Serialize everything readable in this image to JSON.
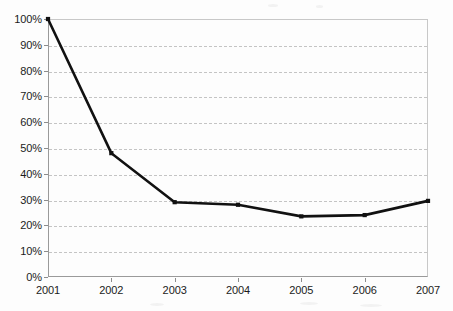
{
  "chart_data": {
    "type": "line",
    "title": "",
    "subtitle": "",
    "xlabel": "",
    "ylabel": "",
    "categories": [
      "2001",
      "2002",
      "2003",
      "2004",
      "2005",
      "2006",
      "2007"
    ],
    "series": [
      {
        "name": "",
        "values": [
          100,
          48,
          29,
          28,
          23.5,
          24,
          29.5
        ]
      }
    ],
    "ylim": [
      0,
      100
    ],
    "y_ticks": [
      0,
      10,
      20,
      30,
      40,
      50,
      60,
      70,
      80,
      90,
      100
    ],
    "y_tick_labels": [
      "0%",
      "10%",
      "20%",
      "30%",
      "40%",
      "50%",
      "60%",
      "70%",
      "80%",
      "90%",
      "100%"
    ],
    "x_tick_labels": [
      "2001",
      "2002",
      "2003",
      "2004",
      "2005",
      "2006",
      "2007"
    ],
    "grid": {
      "horizontal": true,
      "vertical": false,
      "style": "dashed",
      "color": "#c4c4c4"
    },
    "legend": {
      "visible": false,
      "position": "none",
      "entries": []
    },
    "colors": {
      "line": "#111111",
      "marker": "#111111",
      "axis": "#9a9a9a",
      "gridline": "#c4c4c4",
      "background": "#fdfdfd",
      "text": "#1b1b1b"
    },
    "marker_style": "square",
    "annotations": []
  }
}
